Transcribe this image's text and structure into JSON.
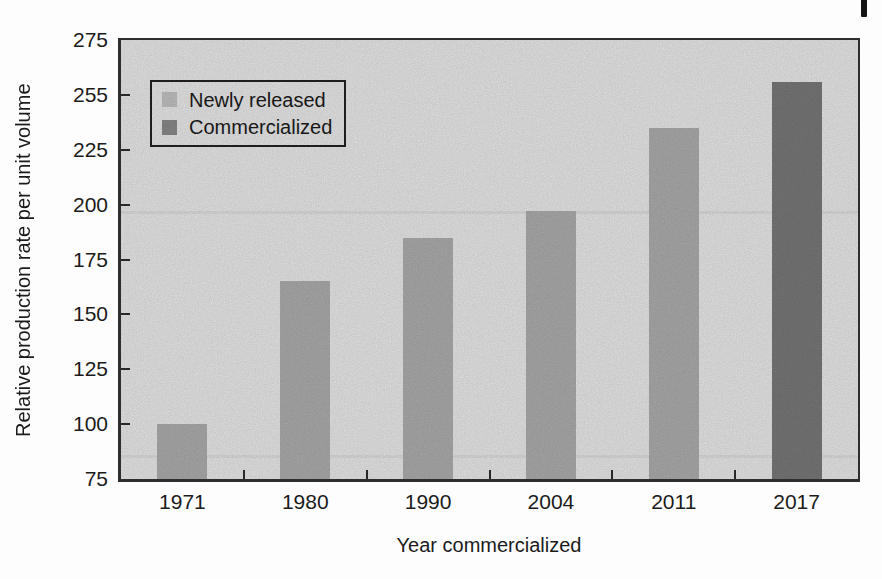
{
  "chart_data": {
    "type": "bar",
    "title": "",
    "xlabel": "Year commercialized",
    "ylabel": "Relative production rate per unit volume",
    "categories": [
      "1971",
      "1980",
      "1990",
      "2004",
      "2011",
      "2017"
    ],
    "values": [
      100,
      165,
      185,
      197,
      235,
      256
    ],
    "bar_series": [
      "newly-released",
      "newly-released",
      "newly-released",
      "newly-released",
      "newly-released",
      "commercialized"
    ],
    "series_colors": {
      "newly-released": "#afafaf",
      "commercialized": "#7a7a7a"
    },
    "ylim": [
      75,
      275
    ],
    "ytick_labels": [
      "75",
      "100",
      "125",
      "150",
      "175",
      "200",
      "225",
      "255",
      "275"
    ],
    "grid": false,
    "legend": {
      "position": "upper-left",
      "items": [
        {
          "label": "Newly released",
          "series": "newly-released",
          "color": "#c4c4c4"
        },
        {
          "label": "Commercialized",
          "series": "commercialized",
          "color": "#8c8c8c"
        }
      ]
    },
    "plot_background": "#ececec",
    "frame_color": "#2e2e2e",
    "text_color": "#1b1b1b"
  }
}
